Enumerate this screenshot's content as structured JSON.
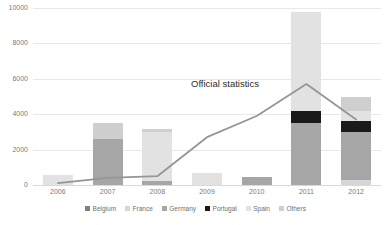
{
  "chart_data": {
    "type": "bar",
    "title": "",
    "xlabel": "",
    "ylabel": "",
    "ylim": [
      0,
      10000
    ],
    "yticks": [
      "0",
      "2000",
      "4000",
      "6000",
      "8000",
      "10000"
    ],
    "ytick_values": [
      0,
      2000,
      4000,
      6000,
      8000,
      10000
    ],
    "grid": true,
    "stacked": true,
    "legend_position": "bottom",
    "categories": [
      "2006",
      "2007",
      "2008",
      "2009",
      "2010",
      "2011",
      "2012"
    ],
    "series": [
      {
        "name": "Belgium",
        "color": "#7f7f7f",
        "values": [
          0,
          0,
          0,
          0,
          0,
          0,
          0
        ]
      },
      {
        "name": "France",
        "color": "#d6d6d6",
        "values": [
          0,
          0,
          0,
          0,
          0,
          0,
          300
        ]
      },
      {
        "name": "Germany",
        "color": "#a6a6a6",
        "values": [
          0,
          2600,
          250,
          0,
          450,
          3500,
          2700
        ]
      },
      {
        "name": "Portugal",
        "color": "#1a1a1a",
        "values": [
          0,
          0,
          0,
          0,
          0,
          700,
          600
        ]
      },
      {
        "name": "Spain",
        "color": "#e2e2e2",
        "values": [
          550,
          0,
          2750,
          700,
          0,
          5600,
          600
        ]
      },
      {
        "name": "Others",
        "color": "#cfcfcf",
        "values": [
          0,
          900,
          150,
          0,
          0,
          0,
          800
        ]
      }
    ],
    "totals": [
      550,
      3500,
      3150,
      700,
      450,
      9800,
      5000
    ],
    "overlay_line": {
      "name": "Official statistics",
      "color": "#969696",
      "values": [
        100,
        400,
        500,
        2700,
        3900,
        5700,
        3700
      ],
      "annotation": "Official statistics"
    }
  },
  "legend": {
    "items": [
      {
        "label": "Belgium",
        "color": "#7f7f7f"
      },
      {
        "label": "France",
        "color": "#d6d6d6"
      },
      {
        "label": "Germany",
        "color": "#a6a6a6"
      },
      {
        "label": "Portugal",
        "color": "#1a1a1a"
      },
      {
        "label": "Spain",
        "color": "#e2e2e2"
      },
      {
        "label": "Others",
        "color": "#cfcfcf"
      }
    ]
  }
}
